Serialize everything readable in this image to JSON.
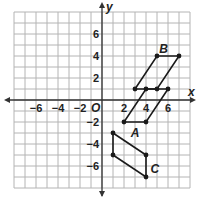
{
  "diagram": {
    "type": "coordinate-plane",
    "grid": {
      "xmin": -8,
      "xmax": 8,
      "ymin": -8,
      "ymax": 8,
      "unit_px": 11,
      "origin_px": [
        102,
        100
      ]
    },
    "colors": {
      "grid": "#b4b4b4",
      "axis": "#333333",
      "shape": "#1a1a1a",
      "background": "#ffffff"
    },
    "axes": {
      "x_label": "x",
      "y_label": "y",
      "origin_label": "O",
      "x_ticks": [
        {
          "value": -6,
          "label": "−6"
        },
        {
          "value": -4,
          "label": "−4"
        },
        {
          "value": -2,
          "label": "−2"
        },
        {
          "value": 2,
          "label": "2"
        },
        {
          "value": 4,
          "label": "4"
        },
        {
          "value": 6,
          "label": "6"
        }
      ],
      "y_ticks": [
        {
          "value": 6,
          "label": "6"
        },
        {
          "value": 4,
          "label": "4"
        },
        {
          "value": 2,
          "label": "2"
        },
        {
          "value": -2,
          "label": "−2"
        },
        {
          "value": -4,
          "label": "−4"
        },
        {
          "value": -6,
          "label": "−6"
        }
      ]
    },
    "shapes": [
      {
        "name": "A",
        "label": "A",
        "vertices": [
          [
            2,
            -2
          ],
          [
            4,
            -2
          ],
          [
            6,
            1
          ],
          [
            4,
            1
          ]
        ],
        "label_pos": [
          3,
          -3
        ]
      },
      {
        "name": "B",
        "label": "B",
        "vertices": [
          [
            3,
            1
          ],
          [
            5,
            1
          ],
          [
            7,
            4
          ],
          [
            5,
            4
          ]
        ],
        "label_pos": [
          5.6,
          4.6
        ]
      },
      {
        "name": "C",
        "label": "C",
        "vertices": [
          [
            1,
            -3
          ],
          [
            4,
            -5
          ],
          [
            4,
            -7
          ],
          [
            1,
            -5
          ]
        ],
        "label_pos": [
          4.8,
          -6.3
        ]
      }
    ]
  }
}
